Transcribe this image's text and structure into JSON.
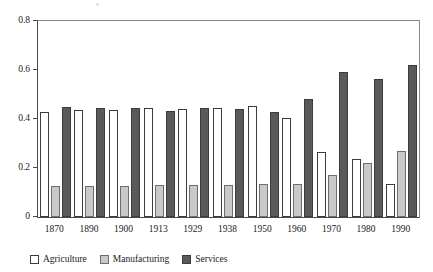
{
  "chart_data": {
    "type": "bar",
    "title": "",
    "subtitle": "",
    "xlabel": "",
    "ylabel": "",
    "categories": [
      "1870",
      "1890",
      "1900",
      "1913",
      "1929",
      "1938",
      "1950",
      "1960",
      "1970",
      "1980",
      "1990"
    ],
    "series": [
      {
        "name": "Agriculture",
        "color": "#ffffff",
        "values": [
          0.43,
          0.435,
          0.437,
          0.447,
          0.44,
          0.447,
          0.455,
          0.405,
          0.265,
          0.238,
          0.135
        ]
      },
      {
        "name": "Manufacturing",
        "color": "#c9c9c9",
        "values": [
          0.125,
          0.127,
          0.125,
          0.13,
          0.13,
          0.13,
          0.133,
          0.135,
          0.17,
          0.222,
          0.27
        ]
      },
      {
        "name": "Services",
        "color": "#5a5a5a",
        "values": [
          0.448,
          0.446,
          0.447,
          0.432,
          0.443,
          0.44,
          0.43,
          0.483,
          0.592,
          0.565,
          0.622
        ]
      }
    ],
    "ylim": [
      0,
      0.8
    ],
    "yticks": [
      0,
      0.2,
      0.4,
      0.6,
      0.8
    ],
    "ytick_labels": [
      "0",
      "0.2",
      "0.4",
      "0.6",
      "0.8"
    ],
    "grid": false,
    "legend_position": "bottom-left",
    "legend_entries": [
      "Agriculture",
      "Manufacturing",
      "Services"
    ]
  }
}
